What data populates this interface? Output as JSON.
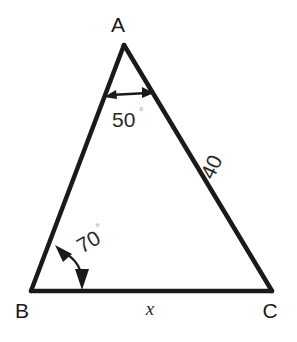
{
  "figure": {
    "type": "triangle-diagram",
    "background_color": "#ffffff",
    "stroke_color": "#1a1a1a",
    "vertices": {
      "apex": {
        "label": "A",
        "x": 124,
        "y": 45
      },
      "bottom_left": {
        "label": "B",
        "x": 31,
        "y": 291
      },
      "bottom_right": {
        "label": "C",
        "x": 272,
        "y": 291
      }
    },
    "vertex_labels": {
      "a": "A",
      "b": "B",
      "c": "C"
    },
    "angles": [
      {
        "at_vertex": "A",
        "value": "50",
        "degree_symbol": "°",
        "marker": "double-headed-straight-arrow"
      },
      {
        "at_vertex": "B",
        "value": "70",
        "degree_symbol": "°",
        "marker": "double-headed-curved-arrow",
        "text_rotation_deg": -30
      }
    ],
    "sides": [
      {
        "name": "side-ac",
        "label": "40",
        "from": "A",
        "to": "C",
        "text_rotation_deg": -65
      },
      {
        "name": "side-bc",
        "label": "x",
        "from": "B",
        "to": "C",
        "text_rotation_deg": 0
      }
    ]
  }
}
